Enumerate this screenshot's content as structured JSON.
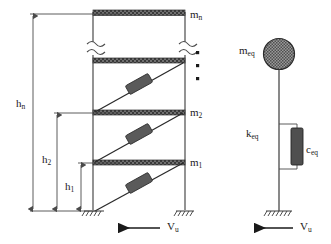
{
  "figure": {
    "colors": {
      "line": "#4a4a4a",
      "slab_fill": "#6e6e6e",
      "damper_fill": "#5a5a5a",
      "mass_fill": "#8c8c8c",
      "text": "#1a1a1a",
      "arrow": "#1a1a1a"
    }
  },
  "mdof": {
    "name": "multi-degree-of-freedom braced frame",
    "floor_labels": [
      {
        "key": "mn",
        "text": "m",
        "sub": "n",
        "x": 190,
        "y": 9
      },
      {
        "key": "m2",
        "text": "m",
        "sub": "2",
        "x": 190,
        "y": 108
      },
      {
        "key": "m1",
        "text": "m",
        "sub": "1",
        "x": 190,
        "y": 158
      }
    ],
    "dimension_labels": [
      {
        "key": "hn",
        "text": "h",
        "sub": "n",
        "x": 18,
        "y": 99
      },
      {
        "key": "h2",
        "text": "h",
        "sub": "2",
        "x": 44,
        "y": 155
      },
      {
        "key": "h1",
        "text": "h",
        "sub": "1",
        "x": 67,
        "y": 182
      }
    ],
    "continuation_dots": 3,
    "break_symbols": 2,
    "brace_count": 3,
    "base_load": {
      "text": "V",
      "sub": "u",
      "x": 168,
      "y": 224
    }
  },
  "sdof": {
    "name": "equivalent single-degree-of-freedom system",
    "mass_label": {
      "text": "m",
      "sub": "eq",
      "x": 240,
      "y": 47
    },
    "stiffness_label": {
      "text": "k",
      "sub": "eq",
      "x": 247,
      "y": 130
    },
    "damper_label": {
      "text": "c",
      "sub": "eq",
      "x": 305,
      "y": 147
    },
    "base_load": {
      "text": "V",
      "sub": "u",
      "x": 301,
      "y": 224
    }
  }
}
